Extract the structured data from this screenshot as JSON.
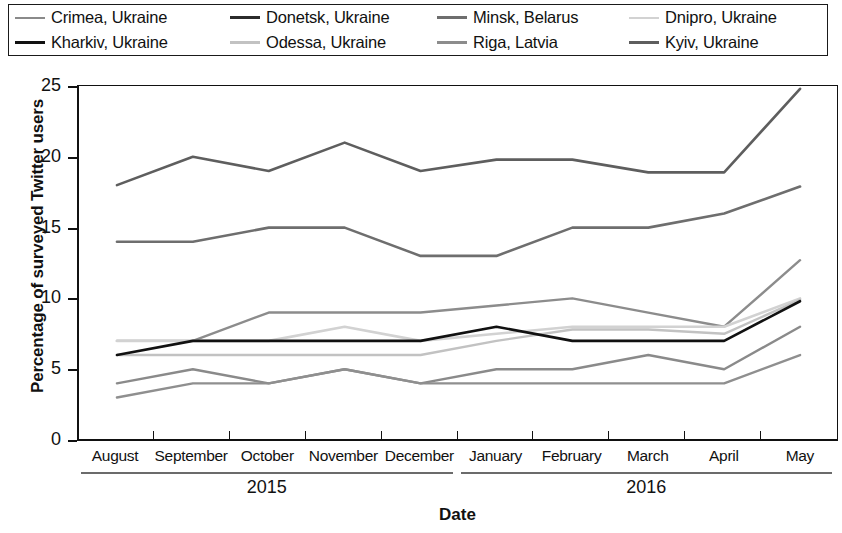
{
  "legend": {
    "items": [
      {
        "label": "Crimea, Ukraine",
        "color": "#8a8a8a",
        "width": 2.4
      },
      {
        "label": "Donetsk, Ukraine",
        "color": "#2b2b2b",
        "width": 3.2
      },
      {
        "label": "Minsk, Belarus",
        "color": "#6e6e6e",
        "width": 3.2
      },
      {
        "label": "Dnipro, Ukraine",
        "color": "#d2d2d2",
        "width": 2.6
      },
      {
        "label": "Kharkiv, Ukraine",
        "color": "#111111",
        "width": 3.4
      },
      {
        "label": "Odessa, Ukraine",
        "color": "#c2c2c2",
        "width": 3.0
      },
      {
        "label": "Riga, Latvia",
        "color": "#8c8c8c",
        "width": 3.2
      },
      {
        "label": "Kyiv, Ukraine",
        "color": "#5e5e5e",
        "width": 3.2
      }
    ]
  },
  "axes": {
    "y_ticks": [
      "0",
      "5",
      "10",
      "15",
      "20",
      "25"
    ],
    "x_ticks": [
      "August",
      "September",
      "October",
      "November",
      "December",
      "January",
      "February",
      "March",
      "April",
      "May"
    ],
    "year_groups": [
      {
        "label": "2015",
        "start": 0,
        "end": 5
      },
      {
        "label": "2016",
        "start": 5,
        "end": 10
      }
    ]
  },
  "chart_data": {
    "type": "line",
    "title": "",
    "xlabel": "Date",
    "ylabel": "Percentage of surveyed Twitter users",
    "ylim": [
      0,
      25
    ],
    "yticks": [
      0,
      5,
      10,
      15,
      20,
      25
    ],
    "grid": false,
    "legend_position": "top",
    "categories": [
      "August",
      "September",
      "October",
      "November",
      "December",
      "January",
      "February",
      "March",
      "April",
      "May"
    ],
    "category_years": [
      "2015",
      "2015",
      "2015",
      "2015",
      "2015",
      "2016",
      "2016",
      "2016",
      "2016",
      "2016"
    ],
    "series": [
      {
        "name": "Kyiv, Ukraine",
        "color": "#5e5e5e",
        "width": 2.6,
        "values": [
          18,
          20,
          19,
          21,
          19,
          19.8,
          19.8,
          18.9,
          18.9,
          24.8
        ]
      },
      {
        "name": "Minsk, Belarus",
        "color": "#6e6e6e",
        "width": 2.6,
        "values": [
          14,
          14,
          15,
          15,
          13,
          13,
          15,
          15,
          16,
          17.9
        ]
      },
      {
        "name": "Riga, Latvia",
        "color": "#8c8c8c",
        "width": 2.4,
        "values": [
          7,
          7,
          9,
          9,
          9,
          9.5,
          10,
          9,
          8,
          12.7
        ]
      },
      {
        "name": "Dnipro, Ukraine",
        "color": "#d2d2d2",
        "width": 2.6,
        "values": [
          7,
          7,
          7,
          8,
          7,
          7.5,
          8,
          8,
          8,
          10
        ]
      },
      {
        "name": "Odessa, Ukraine",
        "color": "#c2c2c2",
        "width": 2.4,
        "values": [
          6,
          6,
          6,
          6,
          6,
          7,
          7.8,
          7.8,
          7.5,
          9.9
        ]
      },
      {
        "name": "Kharkiv, Ukraine",
        "color": "#111111",
        "width": 2.6,
        "values": [
          6,
          7,
          7,
          7,
          7,
          8,
          7,
          7,
          7,
          9.8
        ]
      },
      {
        "name": "Crimea, Ukraine",
        "color": "#8a8a8a",
        "width": 2.4,
        "values": [
          4,
          5,
          4,
          5,
          4,
          5,
          5,
          6,
          5,
          8
        ]
      },
      {
        "name": "Donetsk, Ukraine",
        "color": "#8f8f8f",
        "width": 2.4,
        "values": [
          3,
          4,
          4,
          5,
          4,
          4,
          4,
          4,
          4,
          6
        ]
      }
    ]
  }
}
